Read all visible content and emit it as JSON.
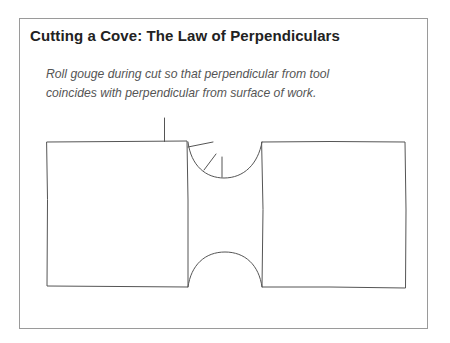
{
  "figure": {
    "title": "Cutting a Cove: The Law of Perpendiculars",
    "caption_lines": [
      "Roll gouge during cut so that perpendicular from tool",
      "coincides with perpendicular from surface of work."
    ],
    "colors": {
      "frame": "#9a9a9a",
      "stroke": "#555555",
      "title": "#222222",
      "caption": "#555555"
    }
  },
  "diagram": {
    "elements": [
      {
        "name": "left-block",
        "shape": "rectangle"
      },
      {
        "name": "right-block",
        "shape": "rectangle"
      },
      {
        "name": "top-cove",
        "shape": "concave arc"
      },
      {
        "name": "bottom-cove",
        "shape": "convex arc"
      },
      {
        "name": "tool-perpendicular-lines",
        "shape": "short lines"
      }
    ]
  }
}
